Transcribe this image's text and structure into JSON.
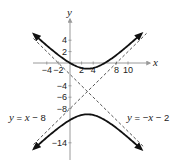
{
  "chart_data": {
    "type": "line",
    "title": "",
    "xlabel": "x",
    "ylabel": "y",
    "xlim": [
      -6.3,
      13.7
    ],
    "ylim": [
      -17,
      7.5
    ],
    "grid": false,
    "x_tick_labels": [
      "-4",
      "-2",
      "2",
      "4",
      "8",
      "10"
    ],
    "x_ticks": [
      -4,
      -2,
      2,
      4,
      8,
      10
    ],
    "y_tick_labels": [
      "4",
      "2",
      "-4",
      "-6",
      "-8",
      "-14"
    ],
    "y_ticks": [
      4,
      2,
      -4,
      -6,
      -8,
      -14
    ],
    "series": [
      {
        "name": "hyperbola upper branch",
        "equation": "(y+5)^2/16 - (x-3)^2/16 = 1",
        "style": "solid",
        "x": [
          -6.2,
          -4,
          -2,
          0,
          1,
          2,
          3,
          4,
          5,
          6,
          8,
          10,
          12.3
        ],
        "y": [
          4.03,
          3.06,
          1.4,
          0.0,
          -0.53,
          -0.88,
          -1.0,
          -0.88,
          -0.53,
          0.0,
          1.4,
          3.06,
          4.9
        ]
      },
      {
        "name": "hyperbola lower branch",
        "style": "solid",
        "x": [
          -6.2,
          -4,
          -2,
          0,
          1,
          2,
          3,
          4,
          5,
          6,
          8,
          10,
          12.3
        ],
        "y": [
          -14.03,
          -13.06,
          -11.4,
          -10.0,
          -9.47,
          -9.12,
          -9.0,
          -9.12,
          -9.47,
          -10.0,
          -11.4,
          -13.06,
          -14.9
        ]
      },
      {
        "name": "asymptote y = x - 8",
        "style": "dashed",
        "x": [
          -6.3,
          13.2
        ],
        "y": [
          -14.3,
          5.2
        ]
      },
      {
        "name": "asymptote y = -x - 2",
        "style": "dashed",
        "x": [
          -6.3,
          12.8
        ],
        "y": [
          4.3,
          -14.8
        ]
      }
    ],
    "annotations": [
      {
        "text": "y = x − 8",
        "near": "left, y≈-8 level"
      },
      {
        "text": "y = −x − 2",
        "near": "right, y≈-8 level"
      }
    ],
    "legend": "none"
  },
  "labels": {
    "x_axis": "x",
    "y_axis": "y",
    "eq_left": {
      "y": "y",
      "rest": " = ",
      "x": "x",
      "tail": " − 8"
    },
    "eq_right": {
      "y": "y",
      "rest": " = −",
      "x": "x",
      "tail": " − 2"
    }
  },
  "colors": {
    "curve": "#111111",
    "asymptote": "#555555",
    "axis": "#9a9a9a"
  }
}
